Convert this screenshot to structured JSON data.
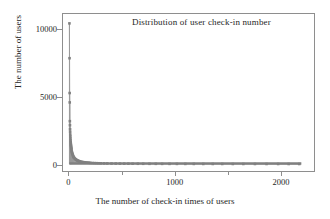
{
  "chart_data": {
    "type": "scatter",
    "title": "Distribution of user check-in number",
    "xlabel": "The number of check-in times of users",
    "ylabel": "The number of users",
    "xlim": [
      -60,
      2320
    ],
    "ylim": [
      -520,
      11200
    ],
    "xticks": [
      0,
      1000,
      2000
    ],
    "xtick_labels": [
      "0",
      "1000",
      "2000"
    ],
    "xticks_minor": [
      500,
      1500
    ],
    "yticks": [
      0,
      5000,
      10000
    ],
    "ytick_labels": [
      "0",
      "5000",
      "10000"
    ],
    "grid": false,
    "legend": false,
    "marker": "square",
    "marker_color": "#808080",
    "line_color": "#9a9a9a",
    "frame_color": "#8e8e8e",
    "x": [
      1,
      2,
      3,
      4,
      5,
      6,
      7,
      8,
      9,
      10,
      11,
      12,
      13,
      14,
      15,
      16,
      17,
      18,
      19,
      20,
      22,
      24,
      26,
      28,
      30,
      33,
      36,
      39,
      42,
      45,
      50,
      55,
      60,
      65,
      70,
      75,
      80,
      85,
      90,
      95,
      100,
      110,
      120,
      130,
      140,
      150,
      160,
      170,
      180,
      190,
      200,
      220,
      240,
      260,
      280,
      300,
      330,
      360,
      400,
      440,
      480,
      520,
      560,
      600,
      650,
      700,
      760,
      820,
      880,
      950,
      1020,
      1100,
      1180,
      1270,
      1360,
      1450,
      1550,
      1650,
      1760,
      1870,
      1980,
      2080,
      2180
    ],
    "y": [
      10500,
      7900,
      5300,
      4600,
      3200,
      2900,
      2600,
      2400,
      2200,
      2050,
      1900,
      1760,
      1640,
      1530,
      1440,
      1360,
      1280,
      1210,
      1150,
      1090,
      990,
      910,
      840,
      780,
      730,
      660,
      600,
      550,
      510,
      475,
      425,
      385,
      350,
      320,
      295,
      272,
      252,
      235,
      220,
      207,
      195,
      175,
      158,
      144,
      132,
      122,
      113,
      105,
      98,
      92,
      87,
      78,
      70,
      64,
      58,
      54,
      48,
      43,
      38,
      34,
      30,
      27,
      25,
      23,
      20,
      18,
      16,
      15,
      13,
      12,
      11,
      10,
      9,
      8,
      7,
      7,
      6,
      6,
      5,
      5,
      4,
      4,
      3
    ]
  }
}
